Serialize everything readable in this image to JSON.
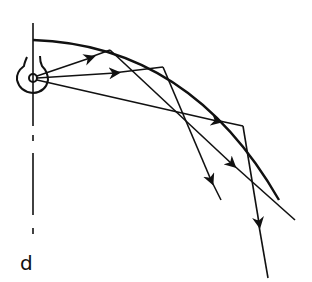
{
  "diagram": {
    "type": "optics-ray-diagram",
    "stroke_color": "#111111",
    "background": "#ffffff",
    "axis_label": "d",
    "source": {
      "cx": 33,
      "cy": 78,
      "r": 4
    },
    "reflector": {
      "start": [
        33,
        40
      ],
      "end": [
        279,
        200
      ]
    },
    "rays": [
      {
        "name": "ray-upper",
        "from": [
          33,
          78
        ],
        "hit": [
          110,
          50
        ],
        "to": [
          295,
          220
        ]
      },
      {
        "name": "ray-middle",
        "from": [
          33,
          78
        ],
        "hit": [
          163,
          67
        ],
        "to": [
          221,
          200
        ]
      },
      {
        "name": "ray-lower",
        "from": [
          33,
          78
        ],
        "hit": [
          243,
          126
        ],
        "to": [
          268,
          278
        ]
      }
    ]
  }
}
